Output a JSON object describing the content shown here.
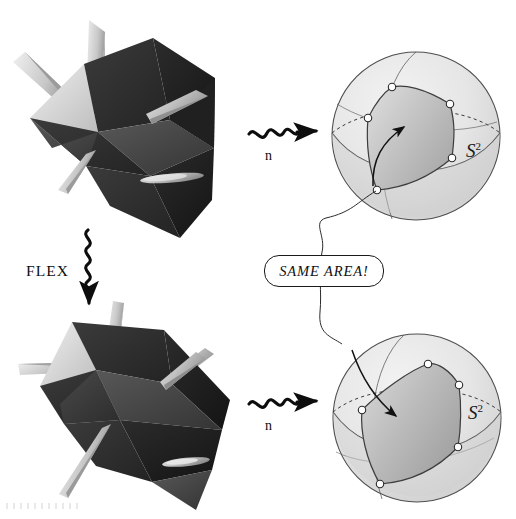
{
  "figure": {
    "width": 516,
    "height": 519,
    "background_color": "#ffffff"
  },
  "labels": {
    "flex": "FLEX",
    "gauss_map_top": "n",
    "gauss_map_bottom": "n",
    "same_area": "SAME AREA!",
    "sphere_top_base": "S",
    "sphere_top_exponent": "2",
    "sphere_bottom_base": "S",
    "sphere_bottom_exponent": "2"
  },
  "colors": {
    "ink": "#1a1a1a",
    "polyhedron_dark_face": "#2e2e2e",
    "polyhedron_mid_face": "#4a4a4a",
    "polyhedron_light_face": "#d8d8d8",
    "spike_light": "#c9c9c9",
    "spike_shade": "#8d8d8d",
    "sphere_fill": "#e8e8e8",
    "sphere_fill_shadow": "#d3d3d3",
    "polygon_fill_light": "#d2d2d2",
    "polygon_fill_dark": "#a8a8a8",
    "vertex_marker": "#ffffff",
    "outline": "#555555"
  },
  "panels": [
    {
      "name": "polyhedron-top",
      "role": "flexible polyhedron, first configuration",
      "region": {
        "x": 8,
        "y": 8,
        "width": 240,
        "height": 235
      },
      "spike_count": 5
    },
    {
      "name": "polyhedron-bottom",
      "role": "flexible polyhedron, flexed configuration",
      "region": {
        "x": 18,
        "y": 300,
        "width": 235,
        "height": 215
      },
      "spike_count": 5
    },
    {
      "name": "sphere-top",
      "role": "unit sphere with Gauss image spherical polygon",
      "center": {
        "x": 416,
        "y": 136
      },
      "radius": 84,
      "polygon_vertex_count": 6,
      "has_dashed_equator": true
    },
    {
      "name": "sphere-bottom",
      "role": "unit sphere with Gauss image spherical polygon after flexing",
      "center": {
        "x": 417,
        "y": 418
      },
      "radius": 84,
      "polygon_vertex_count": 6,
      "has_dashed_equator": true
    }
  ],
  "arrows": {
    "flex_arrow": {
      "name": "flex-squiggle-arrow",
      "direction": "down",
      "style": "squiggly",
      "from": {
        "x": 88,
        "y": 232
      },
      "to": {
        "x": 88,
        "y": 305
      }
    },
    "gauss_arrow_top": {
      "name": "gauss-squiggle-arrow-top",
      "direction": "right",
      "style": "squiggly",
      "from": {
        "x": 249,
        "y": 134
      },
      "to": {
        "x": 322,
        "y": 132
      }
    },
    "gauss_arrow_bottom": {
      "name": "gauss-squiggle-arrow-bottom",
      "direction": "right",
      "style": "squiggly",
      "from": {
        "x": 249,
        "y": 404
      },
      "to": {
        "x": 322,
        "y": 402
      }
    },
    "area_connector": {
      "name": "same-area-connector-curve",
      "style": "thin curved line",
      "connects": [
        "sphere-top",
        "same-area-box",
        "sphere-bottom"
      ]
    }
  }
}
